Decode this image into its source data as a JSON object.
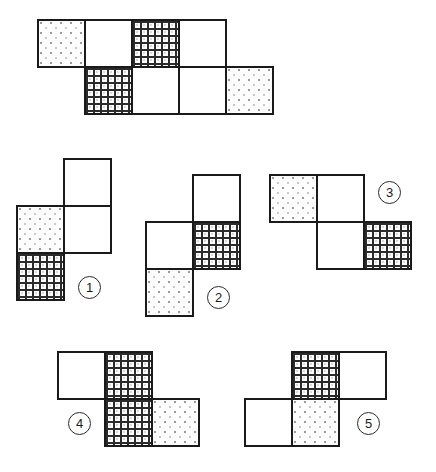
{
  "puzzle": {
    "type": "cube-net-matching",
    "face_patterns": {
      "blank": "plain-white-face",
      "dotted": "stippled-dotted-face",
      "grid": "cross-hatched-graph-face"
    },
    "colors": {
      "outline": "#1a1a1a",
      "grid_line": "#2b2b2b",
      "dot": "#9a9a9a",
      "background": "#ffffff"
    },
    "cell_size": 49
  },
  "prompt_net": {
    "name": "unfolded-cube-net-prompt",
    "origin": {
      "x": 37,
      "y": 19
    },
    "faces": [
      {
        "col": 0,
        "row": 0,
        "pattern": "dotted"
      },
      {
        "col": 1,
        "row": 0,
        "pattern": "blank"
      },
      {
        "col": 2,
        "row": 0,
        "pattern": "grid"
      },
      {
        "col": 3,
        "row": 0,
        "pattern": "blank"
      },
      {
        "col": 1,
        "row": 1,
        "pattern": "grid"
      },
      {
        "col": 2,
        "row": 1,
        "pattern": "blank"
      },
      {
        "col": 3,
        "row": 1,
        "pattern": "blank"
      },
      {
        "col": 4,
        "row": 1,
        "pattern": "dotted"
      }
    ]
  },
  "options": [
    {
      "id": 1,
      "label": "1",
      "name": "option-1",
      "origin": {
        "x": 16,
        "y": 158
      },
      "badge": {
        "x": 78,
        "y": 276
      },
      "faces": [
        {
          "col": 1,
          "row": 0,
          "pattern": "blank"
        },
        {
          "col": 0,
          "row": 1,
          "pattern": "dotted"
        },
        {
          "col": 1,
          "row": 1,
          "pattern": "blank"
        },
        {
          "col": 0,
          "row": 2,
          "pattern": "grid"
        }
      ]
    },
    {
      "id": 2,
      "label": "2",
      "name": "option-2",
      "origin": {
        "x": 145,
        "y": 174
      },
      "badge": {
        "x": 207,
        "y": 286
      },
      "faces": [
        {
          "col": 1,
          "row": 0,
          "pattern": "blank"
        },
        {
          "col": 0,
          "row": 1,
          "pattern": "blank"
        },
        {
          "col": 1,
          "row": 1,
          "pattern": "grid"
        },
        {
          "col": 0,
          "row": 2,
          "pattern": "dotted"
        }
      ]
    },
    {
      "id": 3,
      "label": "3",
      "name": "option-3",
      "origin": {
        "x": 269,
        "y": 174
      },
      "badge": {
        "x": 378,
        "y": 181
      },
      "faces": [
        {
          "col": 0,
          "row": 0,
          "pattern": "dotted"
        },
        {
          "col": 1,
          "row": 0,
          "pattern": "blank"
        },
        {
          "col": 1,
          "row": 1,
          "pattern": "blank"
        },
        {
          "col": 2,
          "row": 1,
          "pattern": "grid"
        }
      ]
    },
    {
      "id": 4,
      "label": "4",
      "name": "option-4",
      "origin": {
        "x": 57,
        "y": 351
      },
      "badge": {
        "x": 68,
        "y": 412
      },
      "faces": [
        {
          "col": 0,
          "row": 0,
          "pattern": "blank"
        },
        {
          "col": 1,
          "row": 0,
          "pattern": "grid"
        },
        {
          "col": 1,
          "row": 1,
          "pattern": "grid"
        },
        {
          "col": 2,
          "row": 1,
          "pattern": "dotted"
        }
      ]
    },
    {
      "id": 5,
      "label": "5",
      "name": "option-5",
      "origin": {
        "x": 244,
        "y": 351
      },
      "badge": {
        "x": 357,
        "y": 412
      },
      "faces": [
        {
          "col": 1,
          "row": 0,
          "pattern": "grid"
        },
        {
          "col": 2,
          "row": 0,
          "pattern": "blank"
        },
        {
          "col": 0,
          "row": 1,
          "pattern": "blank"
        },
        {
          "col": 1,
          "row": 1,
          "pattern": "dotted"
        }
      ]
    }
  ]
}
